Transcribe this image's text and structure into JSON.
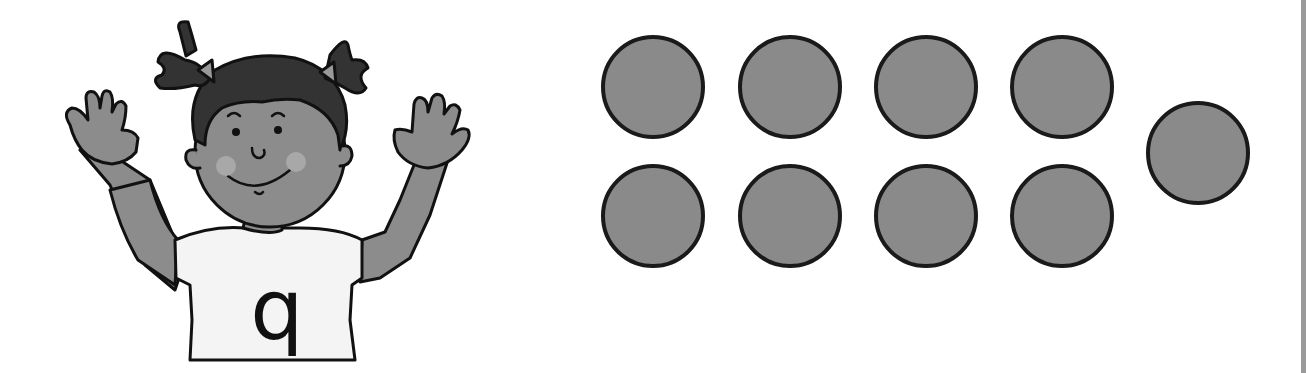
{
  "figure": {
    "character": {
      "description": "cartoon girl with pigtails raising both hands, showing all fingers",
      "shirt_letter": "q"
    },
    "counters": {
      "total": 9,
      "fill_color": "#8a8a8a",
      "stroke_color": "#1a1a1a",
      "items": [
        {
          "row": 1,
          "col": 1,
          "cx": 653,
          "cy": 87,
          "r": 50
        },
        {
          "row": 1,
          "col": 2,
          "cx": 790,
          "cy": 87,
          "r": 50
        },
        {
          "row": 1,
          "col": 3,
          "cx": 926,
          "cy": 87,
          "r": 50
        },
        {
          "row": 1,
          "col": 4,
          "cx": 1062,
          "cy": 87,
          "r": 50
        },
        {
          "row": 2,
          "col": 1,
          "cx": 653,
          "cy": 216,
          "r": 50
        },
        {
          "row": 2,
          "col": 2,
          "cx": 790,
          "cy": 216,
          "r": 50
        },
        {
          "row": 2,
          "col": 3,
          "cx": 926,
          "cy": 216,
          "r": 50
        },
        {
          "row": 2,
          "col": 4,
          "cx": 1062,
          "cy": 216,
          "r": 50
        },
        {
          "row": "extra",
          "col": 5,
          "cx": 1198,
          "cy": 153,
          "r": 50
        }
      ]
    }
  }
}
